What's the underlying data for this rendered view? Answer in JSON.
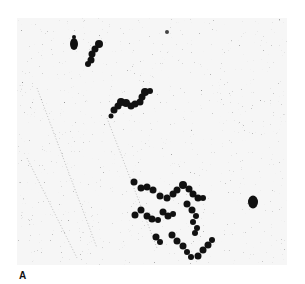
{
  "figure": {
    "panel_label": "A",
    "colors": {
      "background": "#ffffff",
      "field": "#f4f4f4",
      "speckle": "#555555",
      "particles": "#111111"
    }
  }
}
